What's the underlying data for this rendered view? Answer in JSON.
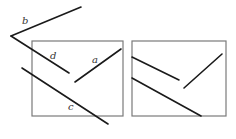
{
  "diagram": {
    "left_panel": {
      "labels": {
        "a": "a",
        "b": "b",
        "c": "c",
        "d": "d"
      }
    },
    "right_panel": {
      "labels": {}
    },
    "colors": {
      "line": "#1a1a1a",
      "frame": "#7a7a7a",
      "label": "#333333"
    }
  }
}
